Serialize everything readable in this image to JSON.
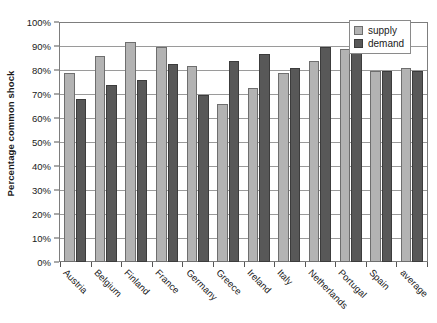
{
  "chart_data": {
    "type": "bar",
    "title": "",
    "xlabel": "",
    "ylabel": "Percentage common shock",
    "ylim": [
      0,
      100
    ],
    "y_unit": "%",
    "grid": true,
    "legend_position": "top-right",
    "categories": [
      "Austria",
      "Belgium",
      "Finland",
      "France",
      "Germany",
      "Greece",
      "Ireland",
      "Italy",
      "Netherlands",
      "Portugal",
      "Spain",
      "average"
    ],
    "y_ticks": [
      "0%",
      "10%",
      "20%",
      "30%",
      "40%",
      "50%",
      "60%",
      "70%",
      "80%",
      "90%",
      "100%"
    ],
    "y_tick_values": [
      0,
      10,
      20,
      30,
      40,
      50,
      60,
      70,
      80,
      90,
      100
    ],
    "series": [
      {
        "name": "supply",
        "color": "#b3b3b3",
        "values": [
          79,
          86,
          92,
          90,
          82,
          66,
          73,
          79,
          84,
          89,
          80,
          81
        ]
      },
      {
        "name": "demand",
        "color": "#585858",
        "values": [
          68,
          74,
          76,
          83,
          70,
          84,
          87,
          81,
          90,
          94,
          80,
          80
        ]
      }
    ]
  },
  "legend": {
    "items": [
      {
        "label": "supply"
      },
      {
        "label": "demand"
      }
    ]
  }
}
